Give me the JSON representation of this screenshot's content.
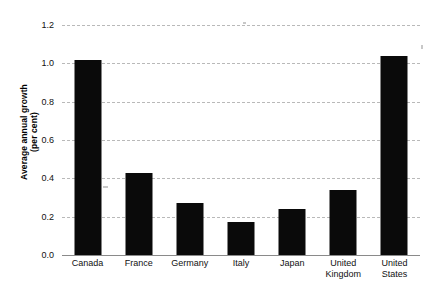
{
  "chart_data": {
    "type": "bar",
    "title": "",
    "subtitle": "",
    "xlabel": "",
    "ylabel": "Average annual growth\n(per cent)",
    "ylabel_lines": [
      "Average annual growth",
      "(per cent)"
    ],
    "categories": [
      "Canada",
      "France",
      "Germany",
      "Italy",
      "Japan",
      "United Kingdom",
      "United States"
    ],
    "category_lines": [
      [
        "Canada"
      ],
      [
        "France"
      ],
      [
        "Germany"
      ],
      [
        "Italy"
      ],
      [
        "Japan"
      ],
      [
        "United",
        "Kingdom"
      ],
      [
        "United",
        "States"
      ]
    ],
    "values": [
      1.02,
      0.43,
      0.27,
      0.17,
      0.24,
      0.34,
      1.04
    ],
    "ylim": [
      0.0,
      1.2
    ],
    "yticks": [
      0.0,
      0.2,
      0.4,
      0.6,
      0.8,
      1.0,
      1.2
    ],
    "ytick_labels": [
      "0.0",
      "0.2",
      "0.4",
      "0.6",
      "0.8",
      "1.0",
      "1.2"
    ],
    "grid": true,
    "grid_axis": "y",
    "grid_style": "dashed",
    "legend": null,
    "legend_position": "none",
    "bar_color": "#0a0a0a",
    "grid_color": "#b9b9b9",
    "axis_color": "#8a8a8a",
    "background_color": "#ffffff"
  }
}
